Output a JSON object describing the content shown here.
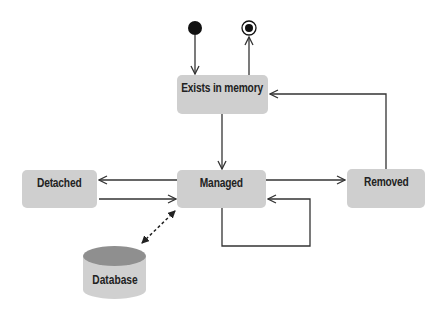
{
  "diagram": {
    "type": "state-diagram",
    "states": [
      {
        "id": "exists",
        "label": "Exists in memory"
      },
      {
        "id": "managed",
        "label": "Managed"
      },
      {
        "id": "detached",
        "label": "Detached"
      },
      {
        "id": "removed",
        "label": "Removed"
      }
    ],
    "datastore": {
      "id": "database",
      "label": "Database"
    },
    "pseudostates": [
      {
        "id": "initial",
        "kind": "initial"
      },
      {
        "id": "final",
        "kind": "final"
      }
    ],
    "transitions": [
      {
        "from": "initial",
        "to": "exists"
      },
      {
        "from": "exists",
        "to": "final"
      },
      {
        "from": "exists",
        "to": "managed"
      },
      {
        "from": "managed",
        "to": "detached"
      },
      {
        "from": "detached",
        "to": "managed"
      },
      {
        "from": "managed",
        "to": "removed"
      },
      {
        "from": "removed",
        "to": "exists"
      },
      {
        "from": "managed",
        "to": "managed"
      },
      {
        "from": "managed",
        "to": "database",
        "style": "dashed-bidirectional"
      }
    ],
    "colors": {
      "state_fill": "#cfcfcf",
      "line": "#333333",
      "db_top": "#8f8f8f",
      "db_body": "#d0d0d0"
    }
  }
}
